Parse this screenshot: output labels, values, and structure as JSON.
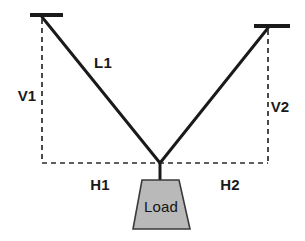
{
  "diagram": {
    "colors": {
      "line": "#1a1a1a",
      "dashed": "#2b2b2b",
      "load_fill": "#b9b9b9",
      "load_stroke": "#3a3a3a",
      "text": "#1a1a1a",
      "background": "#ffffff"
    },
    "anchors": {
      "left": {
        "name": "left-anchor-bar",
        "x1": 30,
        "x2": 63,
        "y": 15,
        "attach_x": 42,
        "attach_y": 17
      },
      "right": {
        "name": "right-anchor-bar",
        "x1": 254,
        "x2": 290,
        "y": 26,
        "attach_x": 268,
        "attach_y": 28
      }
    },
    "junction": {
      "x": 160,
      "y": 163
    },
    "load": {
      "label": "Load",
      "top_left_x": 142,
      "top_right_x": 179,
      "top_y": 180,
      "bottom_left_x": 133,
      "bottom_right_x": 190,
      "bottom_y": 229,
      "text_x": 161,
      "text_y": 206
    },
    "hanger": {
      "x": 160,
      "y_top": 163,
      "y_bottom": 180
    },
    "labels": [
      {
        "key": "L1",
        "text": "L1",
        "x": 103,
        "y": 62,
        "name": "label-l1"
      },
      {
        "key": "V1",
        "text": "V1",
        "x": 27,
        "y": 95,
        "name": "label-v1"
      },
      {
        "key": "V2",
        "text": "V2",
        "x": 280,
        "y": 106,
        "name": "label-v2"
      },
      {
        "key": "H1",
        "text": "H1",
        "x": 100,
        "y": 184,
        "name": "label-h1"
      },
      {
        "key": "H2",
        "text": "H2",
        "x": 230,
        "y": 184,
        "name": "label-h2"
      }
    ],
    "dashed_paths": {
      "left_vertical": {
        "x": 42,
        "y1": 19,
        "y2": 163
      },
      "right_vertical": {
        "x": 268,
        "y1": 30,
        "y2": 163
      },
      "horizontal": {
        "y": 163,
        "x1": 42,
        "x2": 268
      }
    }
  }
}
